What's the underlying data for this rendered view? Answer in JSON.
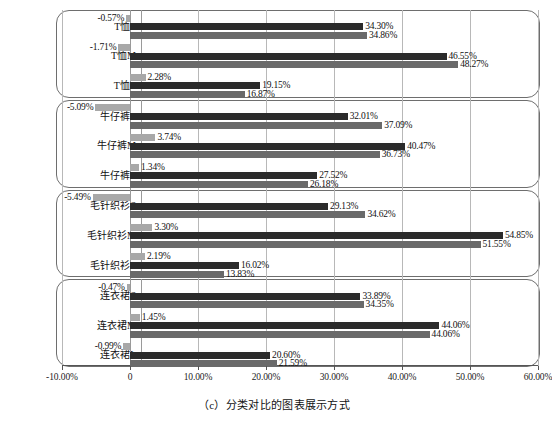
{
  "caption": "（c）分类对比的图表展示方式",
  "chart_data": {
    "type": "bar",
    "orientation": "horizontal",
    "title": "",
    "xlabel": "",
    "ylabel": "",
    "xlim": [
      -10,
      60
    ],
    "xticks": [
      -10,
      0,
      10,
      20,
      30,
      40,
      50,
      60
    ],
    "xtick_labels": [
      "-10.00%",
      "0",
      "10.00%",
      "20.00%",
      "30.00%",
      "40.00%",
      "50.00%",
      "60.00%"
    ],
    "grid": true,
    "legend": "none",
    "series_colors": [
      "#a8a8a8",
      "#2b2b2b",
      "#6a6a6a"
    ],
    "series": [
      {
        "name": "series-1",
        "values": [
          -0.57,
          -1.71,
          2.28,
          -5.09,
          3.74,
          1.34,
          -5.49,
          3.3,
          2.19,
          -0.47,
          1.45,
          -0.99
        ]
      },
      {
        "name": "series-2",
        "values": [
          34.3,
          46.55,
          19.15,
          32.01,
          40.47,
          27.52,
          29.13,
          54.85,
          16.02,
          33.89,
          45.51,
          20.6
        ]
      },
      {
        "name": "series-3",
        "values": [
          34.86,
          48.27,
          16.87,
          37.09,
          36.73,
          26.18,
          34.62,
          51.55,
          13.83,
          34.35,
          44.06,
          21.59
        ]
      }
    ],
    "categories": [
      "T恤S",
      "T恤M",
      "T恤L",
      "牛仔裤S",
      "牛仔裤M",
      "牛仔裤L",
      "毛针织衫S",
      "毛针织衫M",
      "毛针织衫L",
      "连衣裙S",
      "连衣裙M",
      "连衣裙L"
    ],
    "groups": [
      {
        "name": "T恤",
        "rows": [
          {
            "category": "T恤S",
            "values": [
              -0.57,
              34.3,
              34.86
            ],
            "labels": [
              "-0.57%",
              "34.30%",
              "34.86%"
            ]
          },
          {
            "category": "T恤M",
            "values": [
              -1.71,
              46.55,
              48.27
            ],
            "labels": [
              "-1.71%",
              "46.55%",
              "48.27%"
            ]
          },
          {
            "category": "T恤L",
            "values": [
              2.28,
              19.15,
              16.87
            ],
            "labels": [
              "2.28%",
              "19.15%",
              "16.87%"
            ]
          }
        ]
      },
      {
        "name": "牛仔裤",
        "rows": [
          {
            "category": "牛仔裤S",
            "values": [
              -5.09,
              32.01,
              37.09
            ],
            "labels": [
              "-5.09%",
              "32.01%",
              "37.09%"
            ]
          },
          {
            "category": "牛仔裤M",
            "values": [
              3.74,
              40.47,
              36.73
            ],
            "labels": [
              "3.74%",
              "40.47%",
              "36.73%"
            ]
          },
          {
            "category": "牛仔裤L",
            "values": [
              1.34,
              27.52,
              26.18
            ],
            "labels": [
              "1.34%",
              "27.52%",
              "26.18%"
            ]
          }
        ]
      },
      {
        "name": "毛针织衫",
        "rows": [
          {
            "category": "毛针织衫S",
            "values": [
              -5.49,
              29.13,
              34.62
            ],
            "labels": [
              "-5.49%",
              "29.13%",
              "34.62%"
            ]
          },
          {
            "category": "毛针织衫M",
            "values": [
              3.3,
              54.85,
              51.55
            ],
            "labels": [
              "3.30%",
              "54.85%",
              "51.55%"
            ]
          },
          {
            "category": "毛针织衫L",
            "values": [
              2.19,
              16.02,
              13.83
            ],
            "labels": [
              "2.19%",
              "16.02%",
              "13.83%"
            ]
          }
        ]
      },
      {
        "name": "连衣裙",
        "rows": [
          {
            "category": "连衣裙S",
            "values": [
              -0.47,
              33.89,
              34.35
            ],
            "labels": [
              "-0.47%",
              "33.89%",
              "34.35%"
            ]
          },
          {
            "category": "连衣裙M",
            "values": [
              1.45,
              45.51,
              44.06
            ],
            "labels": [
              "1.45%",
              "44.06%",
              "44.06%"
            ]
          },
          {
            "category": "连衣裙L",
            "values": [
              -0.99,
              20.6,
              21.59
            ],
            "labels": [
              "-0.99%",
              "20.60%",
              "21.59%"
            ]
          }
        ]
      }
    ]
  }
}
